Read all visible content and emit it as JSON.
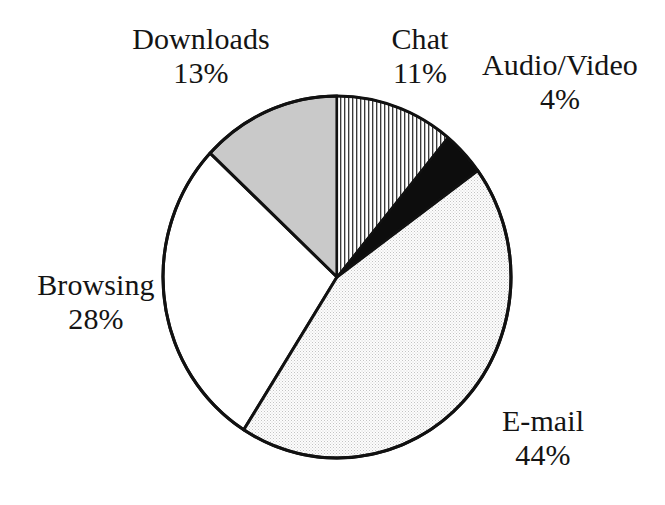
{
  "chart_data": {
    "type": "pie",
    "title": "",
    "subtitle": "",
    "xlabel": "",
    "ylabel": "",
    "legend_position": "none",
    "grid": false,
    "value_unit": "%",
    "total": 100,
    "categories": [
      "Chat",
      "Audio/Video",
      "E-mail",
      "Browsing",
      "Downloads"
    ],
    "values": [
      11,
      4,
      44,
      28,
      13
    ],
    "slices": [
      {
        "label": "Chat",
        "value": 11,
        "value_text": "11%",
        "fill_style": "vertical-hatch",
        "fill_color": "#ffffff",
        "hatch_color": "#2b2b2b",
        "start_angle_deg": 0,
        "end_angle_deg": 39.6
      },
      {
        "label": "Audio/Video",
        "value": 4,
        "value_text": "4%",
        "fill_style": "solid",
        "fill_color": "#0d0d0d",
        "hatch_color": "",
        "start_angle_deg": 39.6,
        "end_angle_deg": 54.0
      },
      {
        "label": "E-mail",
        "value": 44,
        "value_text": "44%",
        "fill_style": "fine-stipple",
        "fill_color": "#fbfbfb",
        "hatch_color": "#b4b4b4",
        "start_angle_deg": 54.0,
        "end_angle_deg": 212.4
      },
      {
        "label": "Browsing",
        "value": 28,
        "value_text": "28%",
        "fill_style": "none",
        "fill_color": "#ffffff",
        "hatch_color": "",
        "start_angle_deg": 212.4,
        "end_angle_deg": 313.2
      },
      {
        "label": "Downloads",
        "value": 13,
        "value_text": "13%",
        "fill_style": "solid",
        "fill_color": "#c9c9c9",
        "hatch_color": "",
        "start_angle_deg": 313.2,
        "end_angle_deg": 360.0
      }
    ],
    "colors": {
      "outline": "#111111",
      "background": "#ffffff",
      "text": "#141414",
      "downloads": "#c9c9c9",
      "audio_video": "#0d0d0d",
      "email": "#fbfbfb",
      "browsing": "#ffffff",
      "chat": "#ffffff"
    },
    "geometry": {
      "center_x": 337,
      "center_y": 277,
      "radius_x": 174,
      "radius_y": 181,
      "stroke_width": 3
    }
  },
  "labels": {
    "downloads": {
      "name": "Downloads",
      "value": "13%"
    },
    "chat": {
      "name": "Chat",
      "value": "11%"
    },
    "audio_video": {
      "name": "Audio/Video",
      "value": "4%"
    },
    "browsing": {
      "name": "Browsing",
      "value": "28%"
    },
    "email": {
      "name": "E-mail",
      "value": "44%"
    }
  }
}
